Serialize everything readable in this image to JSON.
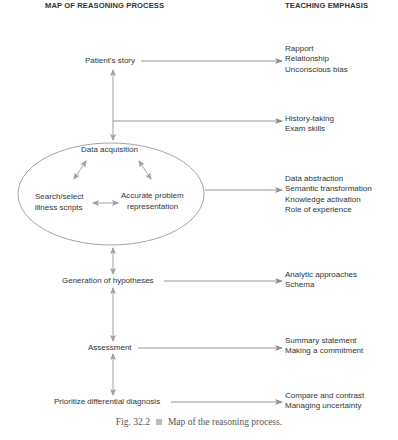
{
  "headers": {
    "left": "MAP OF REASONING PROCESS",
    "right": "TEACHING EMPHASIS"
  },
  "process_steps": {
    "patients_story": "Patient's story",
    "ellipse": {
      "data_acquisition": "Data acquisition",
      "search_select_1": "Search/select",
      "search_select_2": "illness scripts",
      "accurate_1": "Accurate problem",
      "accurate_2": "representation"
    },
    "generation": "Generation of hypotheses",
    "assessment": "Assessment",
    "prioritize": "Prioritize differential diagnosis"
  },
  "teaching_emphasis": {
    "group1": [
      "Rapport",
      "Relationship",
      "Unconscious bias"
    ],
    "group2": [
      "History-taking",
      "Exam skills"
    ],
    "group3": [
      "Data abstraction",
      "Semantic transformation",
      "Knowledge activation",
      "Role of experience"
    ],
    "group4": [
      "Analytic approaches",
      "Schema"
    ],
    "group5": [
      "Summary statement",
      "Making a commitment"
    ],
    "group6": [
      "Compare and contrast",
      "Managing uncertainty"
    ]
  },
  "caption": {
    "fig": "Fig. 32.2",
    "text": "Map of the reasoning process."
  },
  "colors": {
    "line": "#8a8a8a",
    "arrow": "#9a9a9a",
    "text": "#333333"
  }
}
